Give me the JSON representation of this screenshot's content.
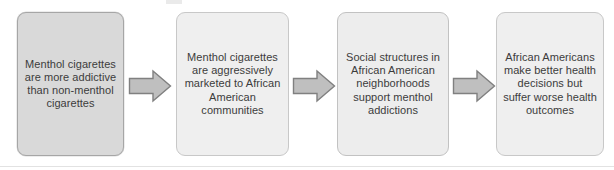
{
  "diagram": {
    "type": "horizontal-flowchart",
    "title": "",
    "step_count": 4,
    "arrow_count": 3,
    "colors": {
      "box_fill_first": "#d9d9d9",
      "box_fill_rest": "#efefef",
      "box_border_first": "#a6a6a6",
      "box_border_rest": "#c8c8c8",
      "arrow_fill": "#bfbfbf",
      "arrow_border": "#808080",
      "text": "#3c3c3c",
      "background": "#ffffff",
      "rule": "#e2e2e2"
    },
    "steps": [
      {
        "index": 1,
        "text": "Menthol cigarettes are more addictive than non-menthol cigarettes"
      },
      {
        "index": 2,
        "text": "Menthol cigarettes are aggressively marketed to African American communities"
      },
      {
        "index": 3,
        "text": "Social structures in African American neighborhoods support menthol addictions"
      },
      {
        "index": 4,
        "text": "African Americans make better health decisions but suffer worse health outcomes"
      }
    ],
    "arrows": [
      {
        "index": 1,
        "icon": "right-block-arrow-icon",
        "from_step": 1,
        "to_step": 2
      },
      {
        "index": 2,
        "icon": "right-block-arrow-icon",
        "from_step": 2,
        "to_step": 3
      },
      {
        "index": 3,
        "icon": "right-block-arrow-icon",
        "from_step": 3,
        "to_step": 4
      }
    ]
  }
}
